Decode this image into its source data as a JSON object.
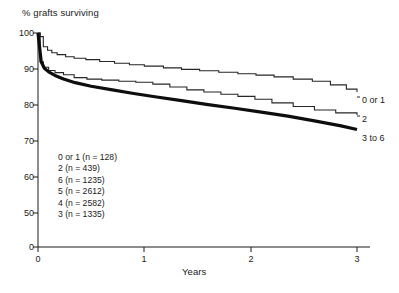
{
  "chart_data": {
    "type": "line",
    "title": "",
    "subtitle": "",
    "ylabel": "% grafts surviving",
    "xlabel": "Years",
    "xlim": [
      0,
      3
    ],
    "ylim": [
      50,
      100
    ],
    "y_axis_break": true,
    "y_break_value": 0,
    "grid": false,
    "legend_position": "inside-lower-left",
    "xticks": [
      "0",
      "1",
      "2",
      "3"
    ],
    "xtick_values": [
      0,
      1,
      2,
      3
    ],
    "yticks": [
      "0",
      "50",
      "60",
      "70",
      "80",
      "90",
      "100"
    ],
    "ytick_values": [
      0,
      50,
      60,
      70,
      80,
      90,
      100
    ],
    "line_style": "step",
    "annotations": [
      {
        "name": "curve-end-label-0-or-1",
        "text": "0 or 1",
        "x": 3.0,
        "y": 80.0
      },
      {
        "name": "curve-end-label-2",
        "text": "2",
        "x": 3.0,
        "y": 75.0
      },
      {
        "name": "curve-end-label-3-to-6",
        "text": "3 to 6",
        "x": 3.0,
        "y": 70.5
      }
    ],
    "legend_entries": [
      {
        "label": "0 or 1 (n = 128)",
        "group": "0 or 1",
        "n": 128
      },
      {
        "label": "2 (n = 439)",
        "group": "2",
        "n": 439
      },
      {
        "label": "6 (n = 1235)",
        "group": "6",
        "n": 1235
      },
      {
        "label": "5 (n = 2612)",
        "group": "5",
        "n": 2612
      },
      {
        "label": "4 (n = 2582)",
        "group": "4",
        "n": 2582
      },
      {
        "label": "3 (n = 1335)",
        "group": "3",
        "n": 1335
      }
    ],
    "series": [
      {
        "name": "0 or 1",
        "style": "thin-step",
        "x": [
          0.0,
          0.02,
          0.05,
          0.09,
          0.13,
          0.18,
          0.26,
          0.34,
          0.45,
          0.58,
          0.72,
          0.86,
          1.0,
          1.18,
          1.35,
          1.52,
          1.7,
          1.88,
          2.05,
          2.22,
          2.4,
          2.58,
          2.75,
          2.9,
          3.0
        ],
        "y": [
          100.0,
          99.0,
          96.2,
          95.2,
          94.5,
          94.0,
          93.4,
          93.0,
          92.6,
          92.1,
          91.6,
          91.2,
          90.8,
          90.3,
          89.9,
          89.5,
          89.1,
          88.7,
          88.3,
          87.8,
          87.2,
          86.6,
          85.6,
          84.4,
          83.6
        ]
      },
      {
        "name": "2",
        "style": "thin-step",
        "x": [
          0.0,
          0.02,
          0.05,
          0.1,
          0.16,
          0.24,
          0.34,
          0.46,
          0.6,
          0.76,
          0.92,
          1.08,
          1.24,
          1.4,
          1.56,
          1.72,
          1.88,
          2.04,
          2.2,
          2.4,
          2.6,
          2.8,
          3.0
        ],
        "y": [
          100.0,
          92.0,
          90.5,
          89.6,
          89.0,
          88.4,
          87.6,
          87.2,
          86.9,
          86.6,
          86.3,
          85.8,
          85.0,
          84.2,
          83.6,
          83.0,
          82.4,
          81.6,
          80.6,
          79.6,
          78.6,
          77.8,
          77.2
        ]
      },
      {
        "name": "3 to 6",
        "style": "thick-smooth",
        "x": [
          0.0,
          0.03,
          0.06,
          0.1,
          0.16,
          0.24,
          0.35,
          0.5,
          0.7,
          0.9,
          1.1,
          1.35,
          1.6,
          1.85,
          2.1,
          2.35,
          2.6,
          2.85,
          3.0
        ],
        "y": [
          100.0,
          92.0,
          90.2,
          89.2,
          88.2,
          87.2,
          86.2,
          85.2,
          84.2,
          83.2,
          82.3,
          81.2,
          80.1,
          79.1,
          78.0,
          76.9,
          75.6,
          74.2,
          73.2
        ]
      }
    ]
  },
  "labels": {
    "y_axis_title": "% grafts surviving",
    "x_axis_title": "Years"
  },
  "colors": {
    "ink": "#1a1a1a",
    "background": "#ffffff",
    "thin_line": "#262626",
    "thick_line": "#0d0d0d"
  }
}
